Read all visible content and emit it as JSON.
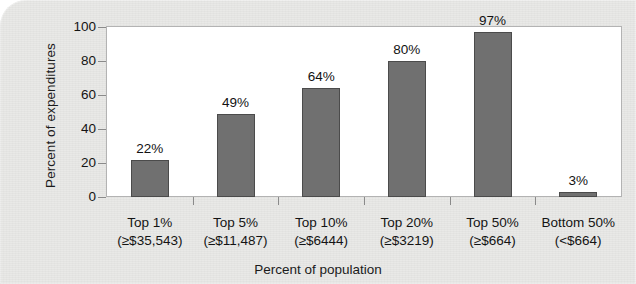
{
  "chart_data": {
    "type": "bar",
    "title": "",
    "subtitle": "",
    "xlabel": "Percent of population",
    "ylabel": "Percent of expenditures",
    "categories": [
      "Top 1%",
      "Top 5%",
      "Top 10%",
      "Top 20%",
      "Top 50%",
      "Bottom 50%"
    ],
    "category_sublabels": [
      "(≥$35,543)",
      "(≥$11,487)",
      "(≥$6444)",
      "(≥$3219)",
      "(≥$664)",
      "(<$664)"
    ],
    "values": [
      22,
      49,
      64,
      80,
      97,
      3
    ],
    "value_labels": [
      "22%",
      "49%",
      "64%",
      "80%",
      "97%",
      "3%"
    ],
    "ylim": [
      0,
      100
    ],
    "yticks": [
      0,
      20,
      40,
      60,
      80,
      100
    ],
    "ytick_labels": [
      "0",
      "20",
      "40",
      "60",
      "80",
      "100"
    ],
    "grid": false,
    "legend": null,
    "bar_color": "#707070",
    "bar_border_color": "#4b4b4b",
    "plot_background": "#ffffff",
    "figure_background": "#e9e9e7",
    "axis_color": "#8a8a8a",
    "text_color": "#141414"
  },
  "axes": {
    "y_title": "Percent of expenditures",
    "x_title": "Percent of population"
  }
}
